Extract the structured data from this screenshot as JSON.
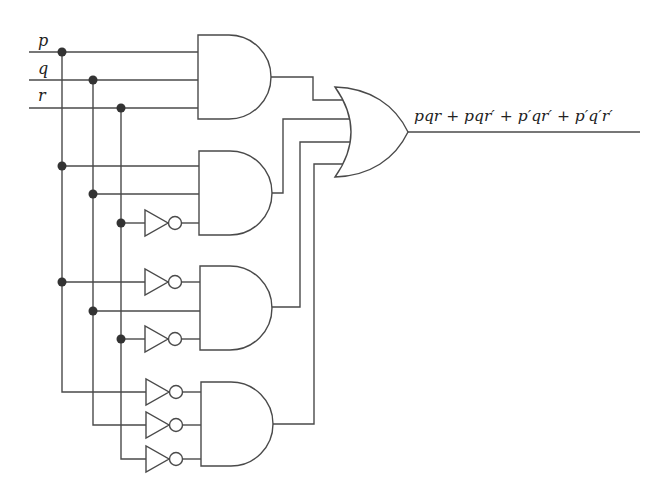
{
  "inputs": [
    {
      "name": "p"
    },
    {
      "name": "q"
    },
    {
      "name": "r"
    }
  ],
  "gates": {
    "and_gates": [
      {
        "id": "and1",
        "inputs": [
          "p",
          "q",
          "r"
        ],
        "term": "pqr"
      },
      {
        "id": "and2",
        "inputs": [
          "p",
          "q",
          "r'"
        ],
        "term": "pqr'"
      },
      {
        "id": "and3",
        "inputs": [
          "p'",
          "q",
          "r'"
        ],
        "term": "p'qr'"
      },
      {
        "id": "and4",
        "inputs": [
          "p'",
          "q'",
          "r'"
        ],
        "term": "p'q'r'"
      }
    ],
    "or_gate": {
      "id": "or1",
      "inputs": [
        "and1",
        "and2",
        "and3",
        "and4"
      ]
    },
    "not_gate_count": 6
  },
  "output": {
    "expression": "pqr + pqr′ + p′qr′ + p′q′r′"
  },
  "colors": {
    "wire": "#4a4a4a",
    "junction": "#333333",
    "background": "#ffffff"
  }
}
